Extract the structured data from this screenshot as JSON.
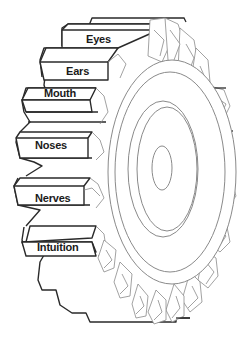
{
  "diagram": {
    "type": "labeled-gear",
    "colors": {
      "outline_dark": "#2a2a2a",
      "outline_light": "#8a8a8a",
      "fill": "#ffffff",
      "label_text": "#1a1a1a"
    },
    "teeth_labels": [
      {
        "id": "eyes",
        "label": "Eyes"
      },
      {
        "id": "ears",
        "label": "Ears"
      },
      {
        "id": "mouth",
        "label": "Mouth"
      },
      {
        "id": "noses",
        "label": "Noses"
      },
      {
        "id": "nerves",
        "label": "Nerves"
      },
      {
        "id": "intuition",
        "label": "Intuition"
      }
    ]
  }
}
